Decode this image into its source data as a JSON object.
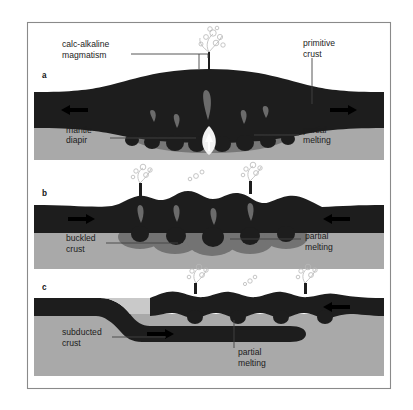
{
  "figure": {
    "border_color": "#8a8a8a",
    "background": "#ffffff",
    "crust_color": "#1d1d1d",
    "mantle_color": "#a9a9a9",
    "melt_color": "#6e6e6e",
    "diapir_color": "#f2f2f2",
    "plume_color": "#bdbdbd",
    "arrow_color": "#000000",
    "leader_color": "#444444"
  },
  "panels": [
    {
      "letter": "a",
      "labels": {
        "magmatism_line1": "calc-alkaline",
        "magmatism_line2": "magmatism",
        "primitive_line1": "primitive",
        "primitive_line2": "crust",
        "mantle_line1": "mantle",
        "mantle_line2": "diapir",
        "partial_line1": "partial",
        "partial_line2": "melting"
      },
      "arrows": [
        {
          "name": "arrow-left",
          "direction": "left"
        },
        {
          "name": "arrow-right",
          "direction": "right"
        }
      ]
    },
    {
      "letter": "b",
      "labels": {
        "buckled_line1": "buckled",
        "buckled_line2": "crust",
        "partial_line1": "partial",
        "partial_line2": "melting"
      },
      "arrows": [
        {
          "name": "arrow-right",
          "direction": "right"
        },
        {
          "name": "arrow-left",
          "direction": "left"
        }
      ]
    },
    {
      "letter": "c",
      "labels": {
        "subducted_line1": "subducted",
        "subducted_line2": "crust",
        "partial_line1": "partial",
        "partial_line2": "melting"
      },
      "arrows": [
        {
          "name": "arrow-right",
          "direction": "right"
        },
        {
          "name": "arrow-left",
          "direction": "left"
        }
      ]
    }
  ]
}
